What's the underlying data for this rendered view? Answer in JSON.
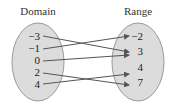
{
  "diagram": {
    "type": "mapping",
    "domain": {
      "label": "Domain",
      "values": [
        "−3",
        "−1",
        "0",
        "2",
        "4"
      ]
    },
    "range": {
      "label": "Range",
      "values": [
        "−2",
        "3",
        "4",
        "7"
      ]
    },
    "mappings": [
      {
        "from": "−3",
        "to": "3"
      },
      {
        "from": "−1",
        "to": "−2"
      },
      {
        "from": "0",
        "to": "3"
      },
      {
        "from": "2",
        "to": "7"
      },
      {
        "from": "4",
        "to": "4"
      }
    ],
    "colors": {
      "oval_fill": "#dcdcdc",
      "oval_stroke": "#9a9a9a",
      "arrow": "#555555"
    }
  }
}
